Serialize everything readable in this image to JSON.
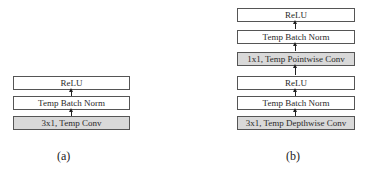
{
  "diagram_a": {
    "caption": "(a)",
    "blocks": [
      {
        "label": "ReLU",
        "shaded": false
      },
      {
        "label": "Temp Batch Norm",
        "shaded": false
      },
      {
        "label": "3x1, Temp Conv",
        "shaded": true
      }
    ]
  },
  "diagram_b": {
    "caption": "(b)",
    "blocks": [
      {
        "label": "ReLU",
        "shaded": false
      },
      {
        "label": "Temp Batch Norm",
        "shaded": false
      },
      {
        "label": "1x1, Temp Pointwise  Conv",
        "shaded": true
      },
      {
        "label": "ReLU",
        "shaded": false
      },
      {
        "label": "Temp Batch Norm",
        "shaded": false
      },
      {
        "label": "3x1, Temp Depthwise Conv",
        "shaded": true
      }
    ]
  },
  "colors": {
    "box_border": "#555555",
    "shaded_fill": "#d9d9d9",
    "arrow": "#222222"
  }
}
